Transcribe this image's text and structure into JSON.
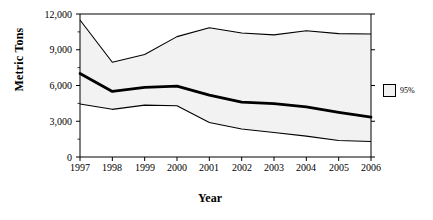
{
  "chart_data": {
    "type": "line",
    "title": "",
    "xlabel": "Year",
    "ylabel": "Metric Tons",
    "categories": [
      "1997",
      "1998",
      "1999",
      "2000",
      "2001",
      "2002",
      "2003",
      "2004",
      "2005",
      "2006"
    ],
    "x": [
      1997,
      1998,
      1999,
      2000,
      2001,
      2002,
      2003,
      2004,
      2005,
      2006
    ],
    "ylim": [
      0,
      12000
    ],
    "xlim": [
      1997,
      2006
    ],
    "yticks": [
      0,
      3000,
      6000,
      9000,
      12000
    ],
    "ytick_labels": [
      "0",
      "3,000",
      "6,000",
      "9,000",
      "12,000"
    ],
    "xtick_labels": [
      "1997",
      "1998",
      "1999",
      "2000",
      "2001",
      "2002",
      "2003",
      "2004",
      "2005",
      "2006"
    ],
    "grid": false,
    "legend": {
      "position": "right",
      "entries": [
        {
          "label": "95%",
          "swatch_color": "#f2f2f2",
          "border_color": "#000000"
        }
      ]
    },
    "band_fill_color": "#f2f2f2",
    "series": [
      {
        "name": "95% upper confidence limit",
        "style": "thin-line",
        "color": "#000000",
        "values": [
          11500,
          7950,
          8600,
          10100,
          10850,
          10400,
          10250,
          10600,
          10350,
          10320
        ]
      },
      {
        "name": "Estimate",
        "style": "bold-line",
        "color": "#000000",
        "values": [
          7000,
          5500,
          5850,
          5950,
          5200,
          4600,
          4480,
          4200,
          3750,
          3350
        ]
      },
      {
        "name": "95% lower confidence limit",
        "style": "thin-line",
        "color": "#000000",
        "values": [
          4450,
          4000,
          4350,
          4300,
          2900,
          2350,
          2050,
          1750,
          1380,
          1300
        ]
      }
    ]
  }
}
